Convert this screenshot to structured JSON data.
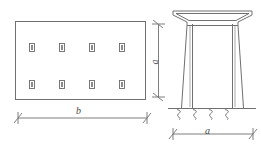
{
  "figure": {
    "type": "engineering-drawing",
    "stroke_color": "#6e6e6e",
    "background_color": "#ffffff",
    "plan_view": {
      "name": "rectangular-footing-plan",
      "outline": {
        "x": 15,
        "y": 21,
        "width": 131,
        "height": 79
      },
      "markers_label": "pile-marker",
      "marker_size": {
        "width": 5,
        "height": 8
      },
      "markers": [
        {
          "x": 29,
          "y": 43
        },
        {
          "x": 59,
          "y": 43
        },
        {
          "x": 89,
          "y": 43
        },
        {
          "x": 119,
          "y": 43
        },
        {
          "x": 29,
          "y": 80
        },
        {
          "x": 59,
          "y": 80
        },
        {
          "x": 89,
          "y": 80
        },
        {
          "x": 119,
          "y": 80
        }
      ],
      "dimension": {
        "name": "width-dimension-b",
        "label": "b",
        "orientation": "horizontal",
        "x1": 18,
        "x2": 147,
        "y": 118
      }
    },
    "elevation_view": {
      "name": "column-elevation",
      "cap": {
        "name": "flared-cap",
        "top_left_x": 173,
        "top_right_x": 252,
        "top_y": 11,
        "inner_left_x": 191,
        "inner_right_x": 234,
        "haunch_y": 21,
        "bottom_y": 25
      },
      "shaft": {
        "name": "column-shaft",
        "outer_left_top_x": 186,
        "outer_right_top_x": 239,
        "outer_left_bottom_x": 181,
        "outer_right_bottom_x": 244,
        "inner_left_x": 192,
        "inner_right_x": 233,
        "top_y": 25,
        "bottom_y": 108
      },
      "ground_line": {
        "name": "ground-line",
        "x1": 168,
        "x2": 256,
        "y": 108
      },
      "springs": {
        "name": "elastic-support-marks",
        "count": 4,
        "positions": [
          180,
          196,
          212,
          228
        ],
        "y": 109,
        "height": 10
      },
      "dimension_horizontal": {
        "name": "width-dimension-a",
        "label": "a",
        "orientation": "horizontal",
        "x1": 170,
        "x2": 255,
        "y": 134
      },
      "dimension_vertical": {
        "name": "height-dimension-a",
        "label": "a",
        "orientation": "vertical",
        "x": 158,
        "y1": 22,
        "y2": 99
      }
    }
  }
}
